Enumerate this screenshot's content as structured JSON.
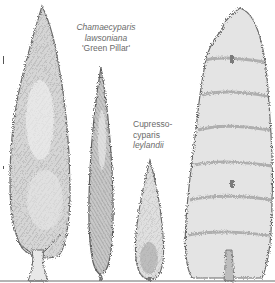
{
  "illustration": {
    "description": "Pencil-style drawing of four conifers side by side on a ground line",
    "background": "#ffffff",
    "ink_color": "#5a5a5a",
    "trees": [
      {
        "id": "tall-conical-left",
        "label": null
      },
      {
        "id": "chamaecyparis",
        "label": "Chamaecyparis lawsoniana 'Green Pillar'"
      },
      {
        "id": "cupressocyparis",
        "label": "Cupressocyparis leylandii"
      },
      {
        "id": "broad-right",
        "label": null
      }
    ]
  },
  "labels": {
    "chamaecyparis": {
      "line1": "Chamaecyparis",
      "line2": "lawsoniana",
      "line3": "'Green Pillar'"
    },
    "cupressocyparis": {
      "line1": "Cupresso-",
      "line2": "cyparis",
      "line3": "leylandii"
    }
  }
}
